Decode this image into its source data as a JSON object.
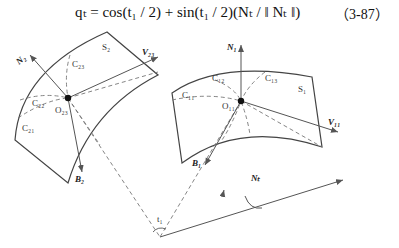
{
  "equation": {
    "text": "q_t = cos(t1 / 2) + sin(t1 / 2)(N_t / || N_t ||)",
    "display": "qₜ = cos(t₁ / 2) + sin(t₁ / 2)(Nₜ / ‖ Nₜ ‖)",
    "number": "（3-87）"
  },
  "labels": {
    "N2": "N₂",
    "V23": "V₂₃",
    "S2": "S₂",
    "C23a": "C₂₃",
    "C22": "C₂₂",
    "C21": "C₂₁",
    "O23": "O₂₃",
    "B2": "B₂",
    "N1": "N₁",
    "C11": "C₁₁",
    "C12": "C₁₂",
    "C13": "C₁₃",
    "S1": "S₁",
    "O11": "O₁₁",
    "V11": "V₁₁",
    "B1": "B₁",
    "Nt": "Nₜ",
    "t1": "t₁"
  }
}
